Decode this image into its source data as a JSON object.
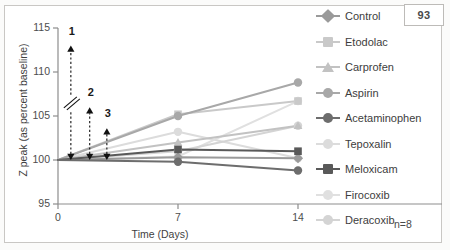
{
  "page": {
    "number": "93"
  },
  "chart_data": {
    "type": "line",
    "title": "",
    "xlabel": "Time (Days)",
    "ylabel": "Z peak (as percent baseline)",
    "x": [
      0,
      7,
      14
    ],
    "xticks": [
      "0",
      "7",
      "14"
    ],
    "yticks": [
      "95",
      "100",
      "105",
      "110",
      "115"
    ],
    "xlim": [
      0,
      14
    ],
    "ylim": [
      95,
      115
    ],
    "grid": false,
    "legend_position": "right",
    "sample_note": "n=8",
    "series": [
      {
        "name": "Control",
        "marker": "diamond",
        "color": "#9a9a9a",
        "values": [
          100.0,
          100.3,
          100.2
        ]
      },
      {
        "name": "Etodolac",
        "marker": "square",
        "color": "#c9c9c9",
        "values": [
          100.0,
          105.2,
          106.7
        ]
      },
      {
        "name": "Carprofen",
        "marker": "triangle",
        "color": "#c2c2c2",
        "values": [
          100.0,
          102.0,
          103.9
        ]
      },
      {
        "name": "Aspirin",
        "marker": "circle",
        "color": "#a8a8a8",
        "values": [
          100.0,
          105.0,
          108.8
        ]
      },
      {
        "name": "Acetaminophen",
        "marker": "circle",
        "color": "#6d6d6d",
        "values": [
          100.0,
          99.8,
          98.8
        ]
      },
      {
        "name": "Tepoxalin",
        "marker": "circle",
        "color": "#dcdcdc",
        "values": [
          100.0,
          103.2,
          100.2
        ]
      },
      {
        "name": "Meloxicam",
        "marker": "square",
        "color": "#595959",
        "values": [
          100.0,
          101.2,
          101.0
        ]
      },
      {
        "name": "Firocoxib",
        "marker": "circle",
        "color": "#e0e0e0",
        "values": [
          100.0,
          100.4,
          106.7
        ]
      },
      {
        "name": "Deracoxib",
        "marker": "circle",
        "color": "#d4d4d4",
        "values": [
          100.0,
          101.0,
          103.9
        ]
      }
    ],
    "annotations": [
      {
        "label": "1",
        "x": 0.75,
        "from": 100.0,
        "to": 113.0,
        "broken": true
      },
      {
        "label": "2",
        "x": 1.85,
        "from": 100.0,
        "to": 106.0,
        "broken": false
      },
      {
        "label": "3",
        "x": 2.85,
        "from": 100.0,
        "to": 103.6,
        "broken": false
      }
    ]
  },
  "legend": {
    "items": [
      {
        "label": "Control"
      },
      {
        "label": "Etodolac"
      },
      {
        "label": "Carprofen"
      },
      {
        "label": "Aspirin"
      },
      {
        "label": "Acetaminophen"
      },
      {
        "label": "Tepoxalin"
      },
      {
        "label": "Meloxicam"
      },
      {
        "label": "Firocoxib"
      },
      {
        "label": "Deracoxib"
      }
    ]
  }
}
